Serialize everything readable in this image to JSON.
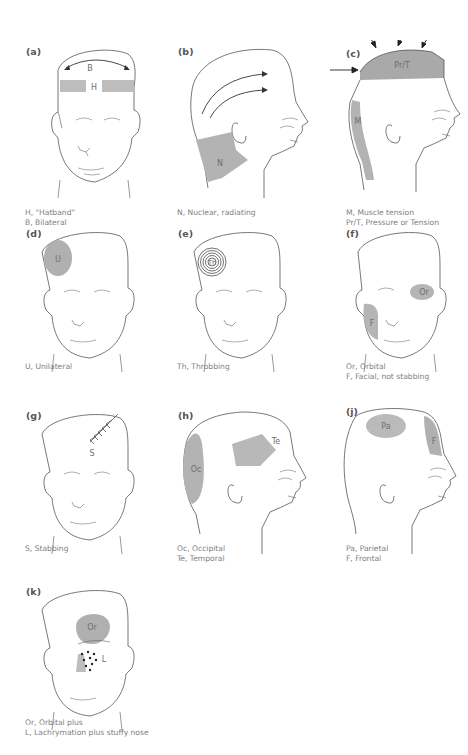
{
  "figure": {
    "panels": [
      {
        "id": "a",
        "label": "(a)",
        "view": "front",
        "regions": [
          {
            "abbr": "H",
            "color": "#bdbdbd"
          },
          {
            "abbr": "B",
            "color": "none"
          }
        ],
        "captions": [
          "H, \"Hatband\"",
          "B, Bilateral"
        ]
      },
      {
        "id": "b",
        "label": "(b)",
        "view": "profile",
        "regions": [
          {
            "abbr": "N",
            "color": "#b3b3b3"
          }
        ],
        "captions": [
          "N, Nuclear, radiating"
        ]
      },
      {
        "id": "c",
        "label": "(c)",
        "view": "profile",
        "regions": [
          {
            "abbr": "Pr/T",
            "color": "#a9a9a9"
          },
          {
            "abbr": "M",
            "color": "#b3b3b3"
          }
        ],
        "captions": [
          "M, Muscle tension",
          "Pr/T, Pressure or Tension"
        ]
      },
      {
        "id": "d",
        "label": "(d)",
        "view": "front",
        "regions": [
          {
            "abbr": "U",
            "color": "#b0b0b0"
          }
        ],
        "captions": [
          "U, Unilateral"
        ]
      },
      {
        "id": "e",
        "label": "(e)",
        "view": "front",
        "regions": [
          {
            "abbr": "Th",
            "color": "none"
          }
        ],
        "captions": [
          "Th, Throbbing"
        ]
      },
      {
        "id": "f",
        "label": "(f)",
        "view": "front",
        "regions": [
          {
            "abbr": "Or",
            "color": "#b5b5b5"
          },
          {
            "abbr": "F",
            "color": "#b5b5b5"
          }
        ],
        "captions": [
          "Or, Orbital",
          "F, Facial, not stabbing"
        ]
      },
      {
        "id": "g",
        "label": "(g)",
        "view": "front",
        "regions": [
          {
            "abbr": "S",
            "color": "none"
          }
        ],
        "captions": [
          "S, Stabbing"
        ]
      },
      {
        "id": "h",
        "label": "(h)",
        "view": "profile",
        "regions": [
          {
            "abbr": "Oc",
            "color": "#b3b3b3"
          },
          {
            "abbr": "Te",
            "color": "#b8b8b8"
          }
        ],
        "captions": [
          "Oc, Occipital",
          "Te, Temporal"
        ]
      },
      {
        "id": "j",
        "label": "(j)",
        "view": "profile",
        "regions": [
          {
            "abbr": "Pa",
            "color": "#bababa"
          },
          {
            "abbr": "F",
            "color": "#b0b0b0"
          }
        ],
        "captions": [
          "Pa, Parietal",
          "F, Frontal"
        ]
      },
      {
        "id": "k",
        "label": "(k)",
        "view": "front",
        "regions": [
          {
            "abbr": "Or",
            "color": "#b0b0b0"
          },
          {
            "abbr": "L",
            "color": "none"
          }
        ],
        "captions": [
          "Or, Orbital plus",
          "L, Lachrymation plus stuffy nose"
        ]
      }
    ]
  }
}
